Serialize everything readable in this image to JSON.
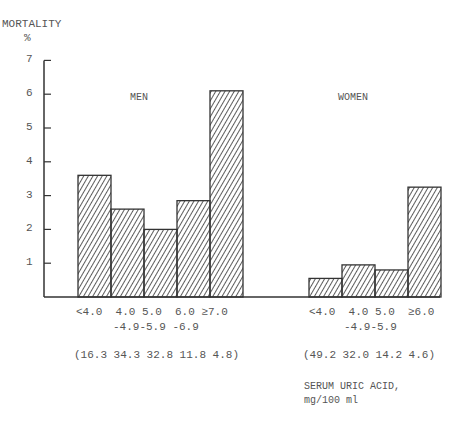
{
  "chart_data": {
    "type": "bar",
    "title": "",
    "ylabel": "MORTALITY %",
    "xlabel": "SERUM URIC ACID, mg/100 ml",
    "ylim": [
      0,
      7
    ],
    "yticks": [
      1,
      2,
      3,
      4,
      5,
      6,
      7
    ],
    "grid": false,
    "groups": [
      {
        "name": "MEN",
        "categories": [
          "<4.0",
          "4.0-4.9",
          "5.0-5.9",
          "6.0-6.9",
          "≥7.0"
        ],
        "values": [
          3.6,
          2.6,
          2.0,
          2.85,
          6.1
        ],
        "population_pct": [
          16.3,
          34.3,
          32.8,
          11.8,
          4.8
        ]
      },
      {
        "name": "WOMEN",
        "categories": [
          "<4.0",
          "4.0-4.9",
          "5.0-5.9",
          "≥6.0"
        ],
        "values": [
          0.55,
          0.95,
          0.8,
          3.25
        ],
        "population_pct": [
          49.2,
          32.0,
          14.2,
          4.6
        ]
      }
    ]
  },
  "labels": {
    "y_title": "MORTALITY",
    "y_unit": "%",
    "men": "MEN",
    "women": "WOMEN",
    "men_tick_row1": "<4.0  4.0 5.0  6.0 ≥7.0",
    "men_tick_row2": "-4.9-5.9 -6.9",
    "men_pct": "(16.3 34.3 32.8 11.8 4.8)",
    "women_tick_row1": "<4.0  4.0 5.0  ≥6.0",
    "women_tick_row2": "-4.9-5.9",
    "women_pct": "(49.2 32.0 14.2 4.6)",
    "x_title_1": "SERUM URIC ACID,",
    "x_title_2": "mg/100 ml"
  },
  "colors": {
    "ink": "#333333",
    "text": "#555555"
  }
}
